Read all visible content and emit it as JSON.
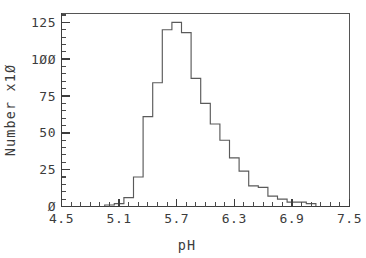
{
  "chart_data": {
    "type": "bar",
    "title": "",
    "subtitle": "",
    "xlabel": "pH",
    "ylabel": "Number  x1Ø",
    "ylabel_plain": "Number x10",
    "xlim": [
      4.5,
      7.5
    ],
    "ylim": [
      0,
      131
    ],
    "grid": false,
    "legend": null,
    "bin_width": 0.1,
    "bar_style": "outline",
    "x_ticks": [
      "4.5",
      "5.1",
      "5.7",
      "6.3",
      "6.9",
      "7.5"
    ],
    "x_tick_values": [
      4.5,
      5.1,
      5.7,
      6.3,
      6.9,
      7.5
    ],
    "x_minor_tick_step": 0.1,
    "y_ticks": [
      "Ø",
      "25",
      "50",
      "75",
      "1ØØ",
      "125"
    ],
    "y_tick_values": [
      0,
      25,
      50,
      75,
      100,
      125
    ],
    "y_minor_tick_step": 5,
    "bin_starts": [
      4.95,
      5.05,
      5.15,
      5.25,
      5.35,
      5.45,
      5.55,
      5.65,
      5.75,
      5.85,
      5.95,
      6.05,
      6.15,
      6.25,
      6.35,
      6.45,
      6.55,
      6.65,
      6.75,
      6.85,
      6.95,
      7.05
    ],
    "categories": [
      "4.95",
      "5.05",
      "5.15",
      "5.25",
      "5.35",
      "5.45",
      "5.55",
      "5.65",
      "5.75",
      "5.85",
      "5.95",
      "6.05",
      "6.15",
      "6.25",
      "6.35",
      "6.45",
      "6.55",
      "6.65",
      "6.75",
      "6.85",
      "6.95",
      "7.05"
    ],
    "values": [
      1,
      2,
      6,
      20,
      61,
      84,
      120,
      125,
      118,
      87,
      70,
      56,
      45,
      33,
      24,
      14,
      13,
      7,
      5,
      3,
      3,
      2
    ],
    "peak_bin": "5.65",
    "peak_value": 125,
    "axis_color": "#3d3d3d",
    "bar_color": "#5a5a5a",
    "background_color": "#ffffff"
  },
  "figure": {
    "x_axis_title": "pH",
    "y_axis_title": "Number  x1Ø"
  }
}
